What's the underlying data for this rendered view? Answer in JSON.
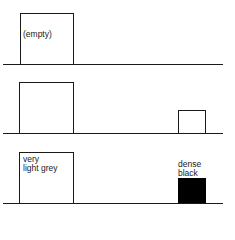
{
  "panels": [
    {
      "id": "panel-1",
      "large_box_label": "(empty)",
      "small_box_label": null
    },
    {
      "id": "panel-2",
      "large_box_label": "",
      "small_box_label": ""
    },
    {
      "id": "panel-3",
      "large_box_label": "very\nlight grey",
      "small_box_label": "dense\nblack"
    }
  ],
  "colors": {
    "line": "#1a1a1a",
    "dense_fill": "#000000",
    "background": "#ffffff"
  }
}
